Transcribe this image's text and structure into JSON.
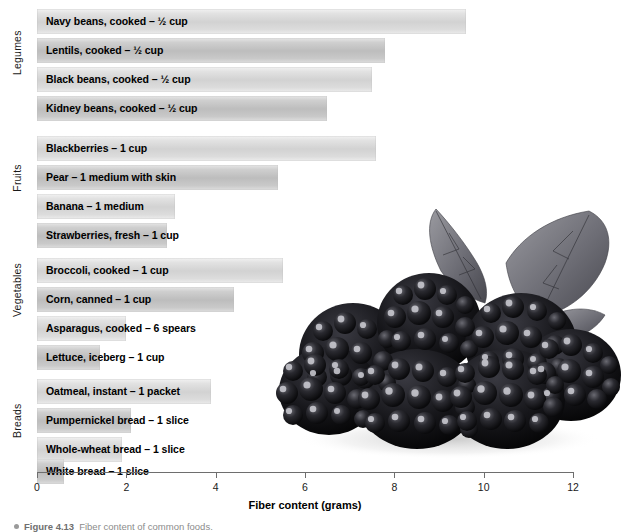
{
  "chart_data": {
    "type": "bar",
    "orientation": "horizontal",
    "title": "",
    "xlabel": "Fiber content (grams)",
    "ylabel": "",
    "xlim": [
      0,
      12
    ],
    "xticks": [
      0,
      2,
      4,
      6,
      8,
      10,
      12
    ],
    "grid": false,
    "legend": "none",
    "groups": [
      {
        "name": "Legumes",
        "categories": [
          "Navy beans, cooked – ½ cup",
          "Lentils, cooked – ½ cup",
          "Black beans, cooked – ½ cup",
          "Kidney beans, cooked – ½ cup"
        ],
        "values": [
          9.6,
          7.8,
          7.5,
          6.5
        ]
      },
      {
        "name": "Fruits",
        "categories": [
          "Blackberries – 1 cup",
          "Pear – 1 medium with skin",
          "Banana – 1 medium",
          "Strawberries, fresh – 1 cup"
        ],
        "values": [
          7.6,
          5.4,
          3.1,
          2.9
        ]
      },
      {
        "name": "Vegetables",
        "categories": [
          "Broccoli, cooked – 1 cup",
          "Corn, canned – 1 cup",
          "Asparagus, cooked – 6 spears",
          "Lettuce, iceberg – 1 cup"
        ],
        "values": [
          5.5,
          4.4,
          2.0,
          1.4
        ]
      },
      {
        "name": "Breads",
        "categories": [
          "Oatmeal, instant – 1 packet",
          "Pumpernickel bread – 1 slice",
          "Whole-wheat bread – 1 slice",
          "White bread – 1 slice"
        ],
        "values": [
          3.9,
          2.1,
          1.9,
          0.6
        ]
      }
    ]
  },
  "axis": {
    "x_title": "Fiber content (grams)",
    "tick_labels": [
      "0",
      "2",
      "4",
      "6",
      "8",
      "10",
      "12"
    ]
  },
  "group_labels": [
    "Legumes",
    "Fruits",
    "Vegetables",
    "Breads"
  ],
  "bars": [
    {
      "label": "Navy beans, cooked – ½ cup",
      "value": 9.6,
      "shade": "light"
    },
    {
      "label": "Lentils, cooked – ½ cup",
      "value": 7.8,
      "shade": "dark"
    },
    {
      "label": "Black beans, cooked – ½ cup",
      "value": 7.5,
      "shade": "light"
    },
    {
      "label": "Kidney beans, cooked – ½ cup",
      "value": 6.5,
      "shade": "dark"
    },
    {
      "label": "Blackberries – 1 cup",
      "value": 7.6,
      "shade": "light"
    },
    {
      "label": "Pear – 1 medium with skin",
      "value": 5.4,
      "shade": "dark"
    },
    {
      "label": "Banana – 1 medium",
      "value": 3.1,
      "shade": "light"
    },
    {
      "label": "Strawberries, fresh – 1 cup",
      "value": 2.9,
      "shade": "dark"
    },
    {
      "label": "Broccoli, cooked – 1 cup",
      "value": 5.5,
      "shade": "light"
    },
    {
      "label": "Corn, canned – 1 cup",
      "value": 4.4,
      "shade": "dark"
    },
    {
      "label": "Asparagus, cooked – 6 spears",
      "value": 2.0,
      "shade": "light"
    },
    {
      "label": "Lettuce, iceberg – 1 cup",
      "value": 1.4,
      "shade": "dark"
    },
    {
      "label": "Oatmeal, instant – 1 packet",
      "value": 3.9,
      "shade": "light"
    },
    {
      "label": "Pumpernickel bread – 1 slice",
      "value": 2.1,
      "shade": "dark"
    },
    {
      "label": "Whole-wheat bread – 1 slice",
      "value": 1.9,
      "shade": "light"
    },
    {
      "label": "White bread – 1 slice",
      "value": 0.6,
      "shade": "dark"
    }
  ],
  "caption": {
    "figure_number": "Figure 4.13",
    "text": "Fiber content of common foods."
  },
  "photo": {
    "alt": "blackberries-photograph"
  },
  "colors": {
    "bar_light": "#d2d2d2",
    "bar_dark": "#bdbdbd",
    "axis": "#6e6e6e",
    "text": "#000000",
    "caption": "#8c8c8c"
  }
}
